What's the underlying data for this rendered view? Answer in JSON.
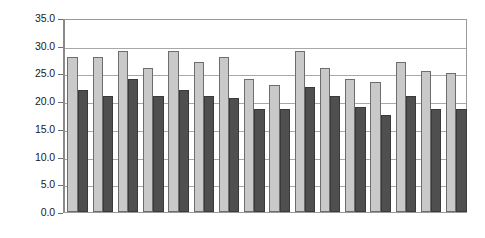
{
  "chart_data": {
    "type": "bar",
    "title": "",
    "subtitle": "",
    "xlabel": "",
    "ylabel": "",
    "ylim": [
      0,
      35
    ],
    "ytick_labels": [
      "0.0",
      "5.0",
      "10.0",
      "15.0",
      "20.0",
      "25.0",
      "30.0",
      "35.0"
    ],
    "ytick_values": [
      0,
      5,
      10,
      15,
      20,
      25,
      30,
      35
    ],
    "grid": true,
    "grid_axis": "y",
    "legend": false,
    "legend_position": "none",
    "xtick_labels": [],
    "categories": [
      "1",
      "2",
      "3",
      "4",
      "5",
      "6",
      "7",
      "8",
      "9",
      "10",
      "11",
      "12",
      "13",
      "14",
      "15",
      "16"
    ],
    "series": [
      {
        "name": "Series A",
        "color": "#c9c9c9",
        "values": [
          28.0,
          28.0,
          29.0,
          26.0,
          29.0,
          27.0,
          28.0,
          24.0,
          23.0,
          29.0,
          26.0,
          24.0,
          23.5,
          27.0,
          25.5,
          25.0
        ]
      },
      {
        "name": "Series B",
        "color": "#4f4f4f",
        "values": [
          22.0,
          21.0,
          24.0,
          21.0,
          22.0,
          21.0,
          20.5,
          18.5,
          18.5,
          22.5,
          21.0,
          19.0,
          17.5,
          21.0,
          18.5,
          18.5
        ]
      }
    ]
  },
  "colors": {
    "series_a": "#c9c9c9",
    "series_b": "#4f4f4f",
    "grid": "#a8a8a8",
    "axis": "#8a8a8a",
    "background": "#ffffff",
    "text": "#1a1a1a"
  }
}
